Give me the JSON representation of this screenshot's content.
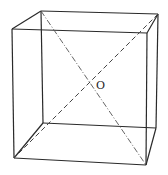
{
  "diagram": {
    "type": "cube-wireframe",
    "label_center": "O",
    "vertices": {
      "back_top_left": [
        41,
        11
      ],
      "back_top_right": [
        158,
        14
      ],
      "back_bottom_left": [
        43,
        123
      ],
      "back_bottom_right": [
        156,
        128
      ],
      "front_top_left": [
        12,
        29
      ],
      "front_top_right": [
        147,
        33
      ],
      "front_bottom_left": [
        14,
        158
      ],
      "front_bottom_right": [
        146,
        165
      ]
    },
    "center": [
      89,
      84
    ],
    "diagonals": [
      {
        "from": "back_top_left",
        "to": "front_bottom_right",
        "style": "dash-dot"
      },
      {
        "from": "back_top_right",
        "to": "front_bottom_left",
        "style": "dashed"
      }
    ]
  }
}
